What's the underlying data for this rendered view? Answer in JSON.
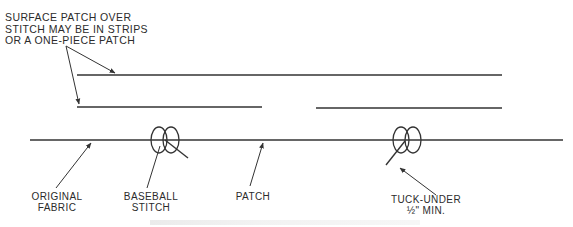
{
  "diagram": {
    "colors": {
      "line": "#333333",
      "text": "#2b2b2b",
      "background": "#ffffff"
    },
    "note": {
      "lines": [
        "SURFACE PATCH OVER",
        "STITCH MAY BE IN STRIPS",
        "OR A ONE-PIECE PATCH"
      ]
    },
    "labels": {
      "original_fabric": [
        "ORIGINAL",
        "FABRIC"
      ],
      "baseball_stitch": [
        "BASEBALL",
        "STITCH"
      ],
      "patch": [
        "PATCH"
      ],
      "tuck_under": [
        "TUCK-UNDER",
        "½\" MIN."
      ]
    },
    "elements": {
      "surface_patch_top": {
        "x1": 77,
        "y1": 75,
        "x2": 502,
        "y2": 75
      },
      "surface_patch_left": {
        "x1": 77,
        "y1": 107,
        "x2": 262,
        "y2": 107
      },
      "surface_patch_right": {
        "x1": 316,
        "y1": 108,
        "x2": 502,
        "y2": 108
      },
      "original_fabric_line": {
        "x1": 30,
        "y1": 140,
        "x2": 563,
        "y2": 140
      },
      "stitches": [
        {
          "name": "baseball-stitch-left",
          "loops": [
            {
              "cx": 159,
              "cy": 140
            },
            {
              "cx": 171,
              "cy": 140
            }
          ],
          "tail": {
            "x1": 165,
            "y1": 140,
            "x2": 188,
            "y2": 158
          }
        },
        {
          "name": "baseball-stitch-right",
          "loops": [
            {
              "cx": 401,
              "cy": 140
            },
            {
              "cx": 413,
              "cy": 140
            }
          ],
          "tail": {
            "x1": 405,
            "y1": 141,
            "x2": 386,
            "y2": 165
          }
        }
      ]
    }
  }
}
